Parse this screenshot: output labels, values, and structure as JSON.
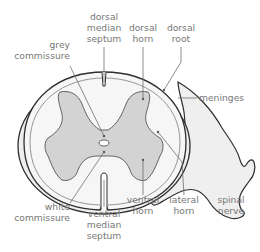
{
  "diagram": {
    "colors": {
      "outline": "#3a3a3a",
      "meninges_fill": "#eeeeee",
      "white_matter": "#f5f5f5",
      "grey_matter": "#d4d4d4",
      "label_text": "#777777"
    },
    "labels": {
      "dorsal_median_septum": [
        "dorsal",
        "median",
        "septum"
      ],
      "grey_commissure": [
        "grey",
        "commissure"
      ],
      "dorsal_horn": [
        "dorsal",
        "horn"
      ],
      "dorsal_root": [
        "dorsal",
        "root"
      ],
      "meninges": [
        "meninges"
      ],
      "white_commissure": [
        "white",
        "commissure"
      ],
      "ventral_median_septum": [
        "ventral",
        "median",
        "septum"
      ],
      "ventral_horn": [
        "ventral",
        "horn"
      ],
      "lateral_horn": [
        "lateral",
        "horn"
      ],
      "spinal_nerve": [
        "spinal",
        "nerve"
      ]
    }
  }
}
